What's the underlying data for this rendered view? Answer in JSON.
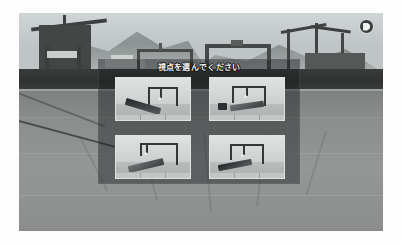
{
  "app": {
    "title": "ガントリークレーン シミュレータ",
    "scene_description": "港湾ドック 3D シーン"
  },
  "watermark": {
    "name": "badge-logo",
    "icon": "play-badge-icon",
    "label": ""
  },
  "background": {
    "sky_label": "曇り空",
    "mountain_label": "遠景の山",
    "quay_label": "岸壁",
    "ground_label": "ドック路面",
    "colors": {
      "sky_top": "#cfd4d6",
      "sky_bottom": "#b4b9ba",
      "mountain": "#8e9392",
      "quay": "#2f3130",
      "ground": "#8b8e8d"
    }
  },
  "panel": {
    "name": "view-selection-dialog",
    "title": "視点を選んでください",
    "background_color": "rgba(26,28,30,0.45)",
    "thumbnails": [
      {
        "index": 1,
        "name": "view-thumbnail-1",
        "label": "視点 1",
        "caption": "船体斜め前方からのガントリークレーン",
        "selected": false
      },
      {
        "index": 2,
        "name": "view-thumbnail-2",
        "label": "視点 2",
        "caption": "岸壁側からのガントリークレーンと貨物",
        "selected": false
      },
      {
        "index": 3,
        "name": "view-thumbnail-3",
        "label": "視点 3",
        "caption": "クレーン真下の船体側面",
        "selected": false
      },
      {
        "index": 4,
        "name": "view-thumbnail-4",
        "label": "視点 4",
        "caption": "後方からのガントリークレーン全景",
        "selected": false
      }
    ]
  }
}
